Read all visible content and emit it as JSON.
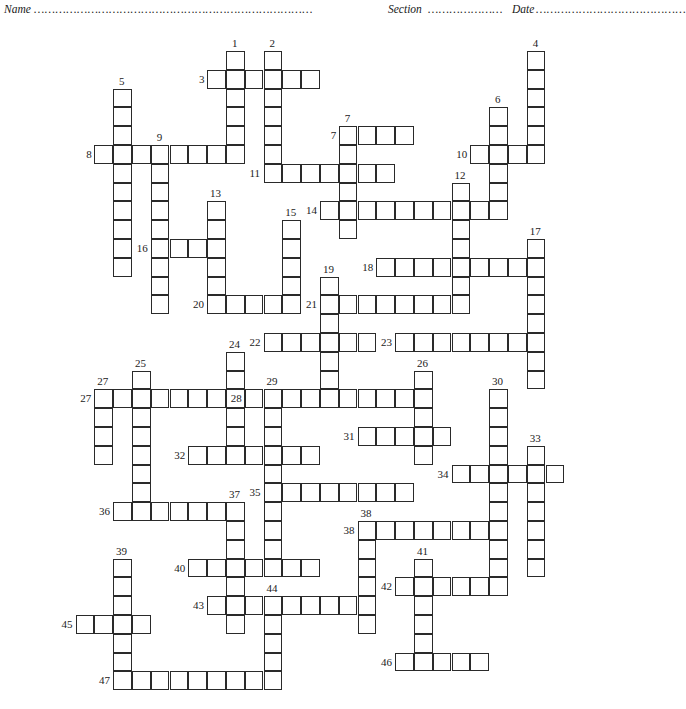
{
  "header": {
    "name_label": "Name",
    "name_dots": "……………………………………………………………………",
    "section_label": "Section",
    "section_dots": "…………………",
    "date_label": "Date",
    "date_dots": "……………………………………"
  },
  "grid": {
    "origin_x": 75.5,
    "origin_y": 51,
    "cell_size": 18.8,
    "border_color": "#2a2a2a"
  },
  "words": [
    {
      "number": "1",
      "dir": "down",
      "col": 8,
      "row": 0,
      "length": 6
    },
    {
      "number": "2",
      "dir": "down",
      "col": 10,
      "row": 0,
      "length": 7
    },
    {
      "number": "3",
      "dir": "across",
      "col": 7,
      "row": 1,
      "length": 6
    },
    {
      "number": "4",
      "dir": "down",
      "col": 24,
      "row": 0,
      "length": 6
    },
    {
      "number": "5",
      "dir": "down",
      "col": 2,
      "row": 2,
      "length": 10
    },
    {
      "number": "6",
      "dir": "down",
      "col": 22,
      "row": 3,
      "length": 6
    },
    {
      "number": "7",
      "dir": "across",
      "col": 14,
      "row": 4,
      "length": 4
    },
    {
      "number": "7",
      "dir": "down",
      "col": 14,
      "row": 4,
      "length": 6
    },
    {
      "number": "8",
      "dir": "across",
      "col": 1,
      "row": 5,
      "length": 8
    },
    {
      "number": "9",
      "dir": "down",
      "col": 4,
      "row": 5,
      "length": 9
    },
    {
      "number": "10",
      "dir": "across",
      "col": 21,
      "row": 5,
      "length": 4
    },
    {
      "number": "11",
      "dir": "across",
      "col": 10,
      "row": 6,
      "length": 7
    },
    {
      "number": "12",
      "dir": "down",
      "col": 20,
      "row": 7,
      "length": 7
    },
    {
      "number": "13",
      "dir": "down",
      "col": 7,
      "row": 8,
      "length": 6
    },
    {
      "number": "14",
      "dir": "across",
      "col": 13,
      "row": 8,
      "length": 10
    },
    {
      "number": "15",
      "dir": "down",
      "col": 11,
      "row": 9,
      "length": 5
    },
    {
      "number": "16",
      "dir": "across",
      "col": 4,
      "row": 10,
      "length": 4
    },
    {
      "number": "17",
      "dir": "down",
      "col": 24,
      "row": 10,
      "length": 8
    },
    {
      "number": "18",
      "dir": "across",
      "col": 16,
      "row": 11,
      "length": 9
    },
    {
      "number": "19",
      "dir": "down",
      "col": 13,
      "row": 12,
      "length": 7
    },
    {
      "number": "20",
      "dir": "across",
      "col": 7,
      "row": 13,
      "length": 5
    },
    {
      "number": "21",
      "dir": "across",
      "col": 13,
      "row": 13,
      "length": 8
    },
    {
      "number": "22",
      "dir": "across",
      "col": 10,
      "row": 15,
      "length": 6
    },
    {
      "number": "23",
      "dir": "across",
      "col": 17,
      "row": 15,
      "length": 8
    },
    {
      "number": "24",
      "dir": "down",
      "col": 8,
      "row": 16,
      "length": 6
    },
    {
      "number": "25",
      "dir": "down",
      "col": 3,
      "row": 17,
      "length": 8
    },
    {
      "number": "26",
      "dir": "down",
      "col": 18,
      "row": 17,
      "length": 5
    },
    {
      "number": "27",
      "dir": "across",
      "col": 1,
      "row": 18,
      "length": 7
    },
    {
      "number": "27",
      "dir": "down",
      "col": 1,
      "row": 18,
      "length": 4
    },
    {
      "number": "28",
      "dir": "across",
      "col": 9,
      "row": 18,
      "length": 10
    },
    {
      "number": "29",
      "dir": "down",
      "col": 10,
      "row": 18,
      "length": 10
    },
    {
      "number": "30",
      "dir": "down",
      "col": 22,
      "row": 18,
      "length": 11
    },
    {
      "number": "31",
      "dir": "across",
      "col": 15,
      "row": 20,
      "length": 5
    },
    {
      "number": "32",
      "dir": "across",
      "col": 6,
      "row": 21,
      "length": 7
    },
    {
      "number": "33",
      "dir": "down",
      "col": 24,
      "row": 21,
      "length": 7
    },
    {
      "number": "34",
      "dir": "across",
      "col": 20,
      "row": 22,
      "length": 6
    },
    {
      "number": "35",
      "dir": "across",
      "col": 10,
      "row": 23,
      "length": 8
    },
    {
      "number": "36",
      "dir": "across",
      "col": 2,
      "row": 24,
      "length": 6
    },
    {
      "number": "37",
      "dir": "down",
      "col": 8,
      "row": 24,
      "length": 7
    },
    {
      "number": "38",
      "dir": "across",
      "col": 15,
      "row": 25,
      "length": 8
    },
    {
      "number": "38",
      "dir": "down",
      "col": 15,
      "row": 25,
      "length": 6
    },
    {
      "number": "39",
      "dir": "down",
      "col": 2,
      "row": 27,
      "length": 7
    },
    {
      "number": "40",
      "dir": "across",
      "col": 6,
      "row": 27,
      "length": 7
    },
    {
      "number": "41",
      "dir": "down",
      "col": 18,
      "row": 27,
      "length": 6
    },
    {
      "number": "42",
      "dir": "across",
      "col": 17,
      "row": 28,
      "length": 6
    },
    {
      "number": "43",
      "dir": "across",
      "col": 7,
      "row": 29,
      "length": 9
    },
    {
      "number": "44",
      "dir": "down",
      "col": 10,
      "row": 29,
      "length": 5
    },
    {
      "number": "45",
      "dir": "across",
      "col": 0,
      "row": 30,
      "length": 4
    },
    {
      "number": "46",
      "dir": "across",
      "col": 17,
      "row": 32,
      "length": 5
    },
    {
      "number": "47",
      "dir": "across",
      "col": 2,
      "row": 33,
      "length": 9
    }
  ]
}
